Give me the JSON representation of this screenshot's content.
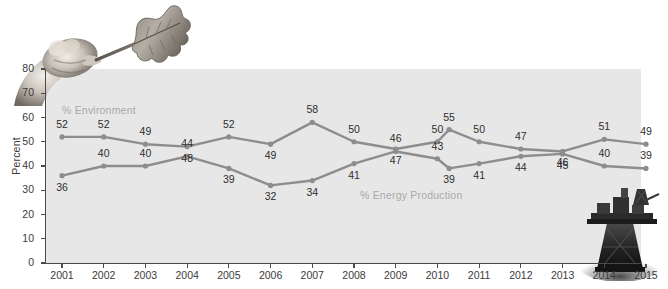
{
  "chart_data": {
    "type": "line",
    "title": "",
    "xlabel": "",
    "ylabel": "Percent",
    "ylim": [
      0,
      80
    ],
    "ytick_labels": [
      "0",
      "10",
      "20",
      "30",
      "40",
      "50",
      "60",
      "70",
      "80"
    ],
    "grid": false,
    "legend_position": "inline-annotations",
    "categories": [
      "2001",
      "2002",
      "2003",
      "2004",
      "2005",
      "2006",
      "2007",
      "2008",
      "2009",
      "2010",
      "2010b",
      "2011",
      "2012",
      "2013",
      "2014",
      "2015"
    ],
    "xtick_labels": [
      "2001",
      "2002",
      "2003",
      "2004",
      "2005",
      "2006",
      "2007",
      "2008",
      "2009",
      "2010",
      "2011",
      "2012",
      "2013",
      "2014",
      "2015"
    ],
    "series": [
      {
        "name": "% Environment",
        "color": "#8d8d8d",
        "values": [
          52,
          52,
          49,
          48,
          52,
          49,
          58,
          50,
          47,
          50,
          55,
          50,
          47,
          46,
          51,
          49
        ]
      },
      {
        "name": "% Energy Production",
        "color": "#8d8d8d",
        "values": [
          36,
          40,
          40,
          44,
          39,
          32,
          34,
          41,
          46,
          43,
          39,
          41,
          44,
          45,
          40,
          39
        ]
      }
    ]
  },
  "annotations": {
    "environment_label": "% Environment",
    "energy_label": "% Energy Production"
  },
  "axis": {
    "y_title": "Percent"
  },
  "images": {
    "leaf_hand_alt": "hand-holding-oak-leaf-photo",
    "oil_rig_alt": "offshore-oil-rig-photo"
  },
  "colors": {
    "plot_background": "#e7e7e7",
    "line": "#8d8d8d",
    "axis": "#4a4a4a",
    "label_text": "#2e2e2e",
    "series_label_text": "#a9a9a9"
  }
}
